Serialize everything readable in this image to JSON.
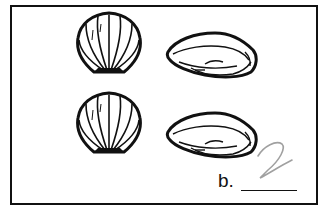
{
  "worksheet": {
    "item_label": "b.",
    "handwritten_answer": "2",
    "shells": [
      {
        "type": "scallop",
        "row": 1
      },
      {
        "type": "clam",
        "row": 1
      },
      {
        "type": "scallop",
        "row": 2
      },
      {
        "type": "clam",
        "row": 2
      }
    ],
    "colors": {
      "ink": "#111111",
      "pencil": "#a0a0a0",
      "background": "#ffffff"
    }
  }
}
